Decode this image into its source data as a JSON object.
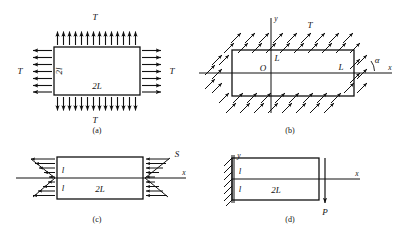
{
  "figure": {
    "panels": [
      {
        "id": "a",
        "caption": "(a)",
        "description": "rectangle under uniform biaxial tension",
        "labels": {
          "top_load": "T",
          "left_load": "T",
          "right_load": "T",
          "bottom_load": "T",
          "height": "2l",
          "width": "2L"
        }
      },
      {
        "id": "b",
        "caption": "(b)",
        "description": "rectangle with inclined uniform loading at angle alpha",
        "labels": {
          "axis_y": "y",
          "axis_x": "x",
          "origin": "O",
          "load": "T",
          "angle": "α",
          "half_height": "L",
          "half_width": "L"
        }
      },
      {
        "id": "c",
        "caption": "(c)",
        "description": "rectangle with triangular shear distribution on the ends",
        "labels": {
          "axis_x": "x",
          "load": "S",
          "half_height_upper": "l",
          "half_height_lower": "l",
          "width": "2L"
        }
      },
      {
        "id": "d",
        "caption": "(d)",
        "description": "cantilever fixed at left wall with end load",
        "labels": {
          "axis_y": "y",
          "axis_x": "x",
          "load": "P",
          "half_height_upper": "l",
          "half_height_lower": "l",
          "width": "2L"
        }
      }
    ],
    "colors": {
      "ink": "#111111",
      "background": "#ffffff"
    }
  }
}
